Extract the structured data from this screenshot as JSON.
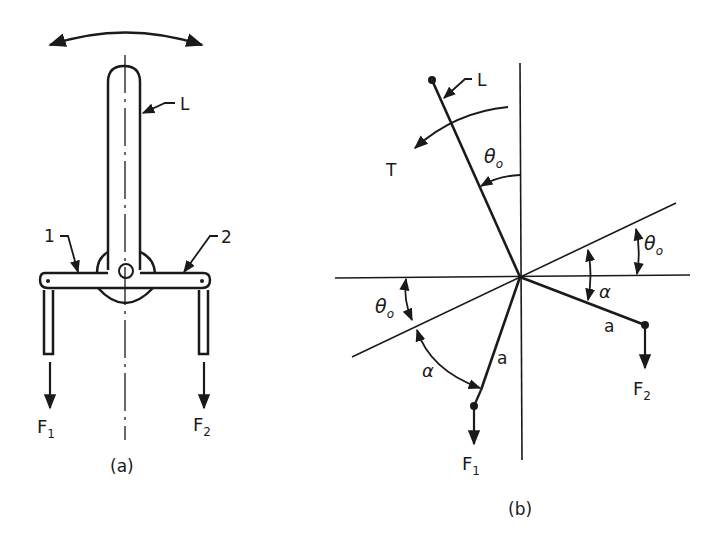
{
  "figure_a": {
    "caption": "(a)",
    "lever_label": "L",
    "arm1_label": "1",
    "arm2_label": "2",
    "force1_label": "F",
    "force1_sub": "1",
    "force2_label": "F",
    "force2_sub": "2"
  },
  "figure_b": {
    "caption": "(b)",
    "lever_label": "L",
    "torque_label": "T",
    "theta_label": "θ",
    "theta_sub": "o",
    "alpha_label": "α",
    "arm_length_label": "a",
    "force1_label": "F",
    "force1_sub": "1",
    "force2_label": "F",
    "force2_sub": "2"
  },
  "colors": {
    "ink": "#1a1a1a",
    "background": "#ffffff"
  }
}
